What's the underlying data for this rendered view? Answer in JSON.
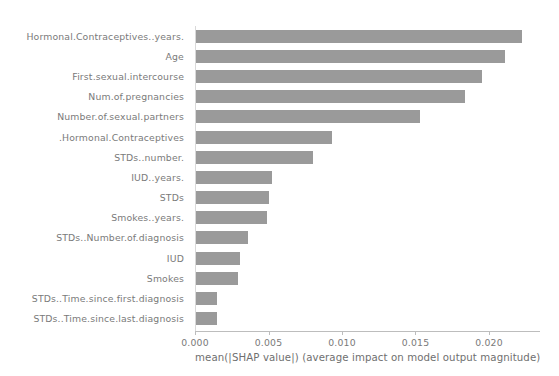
{
  "chart_data": {
    "type": "bar",
    "orientation": "horizontal",
    "title": "",
    "subtitle": "",
    "xlabel": "mean(|SHAP value|) (average impact on model output magnitude)",
    "ylabel": "",
    "xlim": [
      0.0,
      0.02347
    ],
    "xticks": [
      0.0,
      0.005,
      0.01,
      0.015,
      0.02
    ],
    "xticklabels": [
      "0.000",
      "0.005",
      "0.010",
      "0.015",
      "0.020"
    ],
    "grid": false,
    "legend": null,
    "bar_color": "#9a9a9a",
    "text_color": "#7a7a7a",
    "axis_color": "#bdbdbd",
    "background": "#ffffff",
    "categories": [
      "Hormonal.Contraceptives..years.",
      "Age",
      "First.sexual.intercourse",
      "Num.of.pregnancies",
      "Number.of.sexual.partners",
      ".Hormonal.Contraceptives",
      "STDs..number.",
      "IUD..years.",
      "STDs",
      "Smokes..years.",
      "STDs..Number.of.diagnosis",
      "IUD",
      "Smokes",
      "STDs..Time.since.first.diagnosis",
      "STDs..Time.since.last.diagnosis"
    ],
    "values": [
      0.02224,
      0.02109,
      0.01952,
      0.01837,
      0.01531,
      0.00932,
      0.00803,
      0.00524,
      0.00503,
      0.0049,
      0.0036,
      0.00306,
      0.00292,
      0.0015,
      0.0015
    ]
  }
}
